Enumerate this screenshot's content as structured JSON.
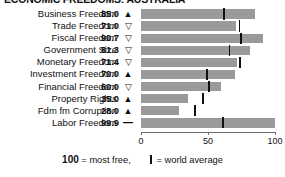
{
  "header": {
    "title": "ECONOMIC FREEDOMS: AUSTRALIA"
  },
  "axis": {
    "ticks": [
      "0",
      "50",
      "100"
    ],
    "min": 0,
    "max": 100
  },
  "legend": {
    "hundred": "100",
    "most_free_text": " = most free,",
    "world_average_text": " = world average"
  },
  "colors": {
    "bar": "#9a9a9a",
    "marker": "#111111",
    "axis": "#6e6e6e",
    "text": "#111111",
    "background": "#ffffff"
  },
  "rows": [
    {
      "label": "Business Freedom",
      "value": "85.0",
      "trend": "▲",
      "trend_name": "up-triangle-filled-icon",
      "score": 85.0,
      "world_average": 62.0
    },
    {
      "label": "Trade Freedom",
      "value": "71.0",
      "trend": "▽",
      "trend_name": "down-triangle-hollow-icon",
      "score": 71.0,
      "world_average": 73.5
    },
    {
      "label": "Fiscal Freedom",
      "value": "90.7",
      "trend": "▽",
      "trend_name": "down-triangle-hollow-icon",
      "score": 90.7,
      "world_average": 74.5
    },
    {
      "label": "Government Size",
      "value": "81.3",
      "trend": "▽",
      "trend_name": "down-triangle-hollow-icon",
      "score": 81.3,
      "world_average": 66.0
    },
    {
      "label": "Monetary Freedom",
      "value": "71.4",
      "trend": "▽",
      "trend_name": "down-triangle-hollow-icon",
      "score": 71.4,
      "world_average": 74.0
    },
    {
      "label": "Investment Freedom",
      "value": "70.0",
      "trend": "▲",
      "trend_name": "up-triangle-filled-icon",
      "score": 70.0,
      "world_average": 49.5
    },
    {
      "label": "Financial Freedom",
      "value": "60.0",
      "trend": "▽",
      "trend_name": "down-triangle-hollow-icon",
      "score": 60.0,
      "world_average": 51.0
    },
    {
      "label": "Property Rights",
      "value": "35.0",
      "trend": "▲",
      "trend_name": "up-triangle-filled-icon",
      "score": 35.0,
      "world_average": 46.5
    },
    {
      "label": "Fdm fm Corruption",
      "value": "28.0",
      "trend": "▲",
      "trend_name": "up-triangle-filled-icon",
      "score": 28.0,
      "world_average": 40.5
    },
    {
      "label": "Labor Freedom",
      "value": "99.9",
      "trend": "—",
      "trend_name": "dash-icon",
      "score": 99.9,
      "world_average": 61.0
    }
  ],
  "chart_data": {
    "type": "bar",
    "orientation": "horizontal",
    "title": "ECONOMIC FREEDOMS: AUSTRALIA",
    "xlabel": "",
    "ylabel": "",
    "xlim": [
      0,
      100
    ],
    "grid": false,
    "legend_position": "bottom",
    "categories": [
      "Business Freedom",
      "Trade Freedom",
      "Fiscal Freedom",
      "Government Size",
      "Monetary Freedom",
      "Investment Freedom",
      "Financial Freedom",
      "Property Rights",
      "Fdm fm Corruption",
      "Labor Freedom"
    ],
    "series": [
      {
        "name": "Score",
        "values": [
          85.0,
          71.0,
          90.7,
          81.3,
          71.4,
          70.0,
          60.0,
          35.0,
          28.0,
          99.9
        ]
      },
      {
        "name": "World average",
        "values": [
          62.0,
          73.5,
          74.5,
          66.0,
          74.0,
          49.5,
          51.0,
          46.5,
          40.5,
          61.0
        ]
      }
    ],
    "annotations": [
      "▲ = improved",
      "▽ = declined",
      "— = unchanged"
    ],
    "xticks": [
      0,
      50,
      100
    ]
  }
}
